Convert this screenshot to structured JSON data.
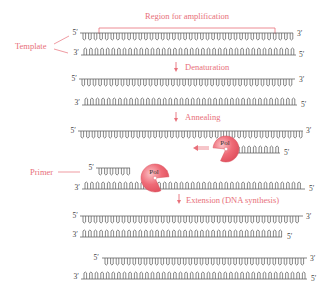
{
  "diagram": {
    "colors": {
      "accent": "#e8707a",
      "strand": "#666666",
      "polymerase": "#ef6b77",
      "polymerase_highlight": "#f9b3b8"
    },
    "labels": {
      "region": "Region for amplification",
      "template": "Template",
      "primer": "Primer",
      "pol": "Pol"
    },
    "steps": [
      {
        "label": "Denaturation"
      },
      {
        "label": "Annealing"
      },
      {
        "label": "Extension (DNA synthesis)"
      }
    ],
    "ends": {
      "five_prime": "5′",
      "three_prime": "3′"
    }
  }
}
